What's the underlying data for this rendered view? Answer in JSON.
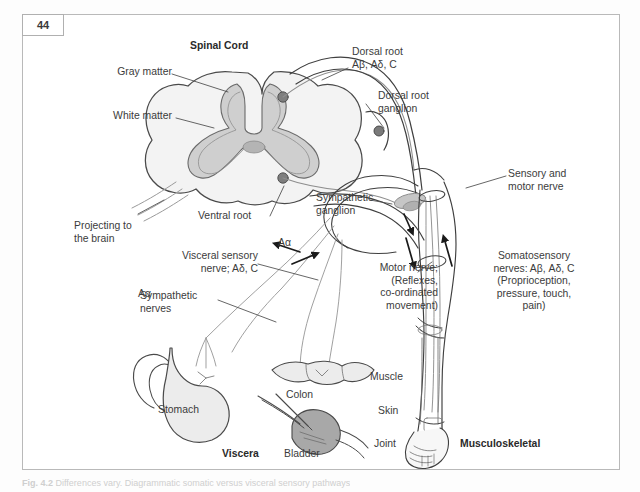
{
  "page": {
    "number": "44",
    "background_color": "#ffffff",
    "frame_color": "#b9b9b9"
  },
  "diagram": {
    "title": "Spinal Cord",
    "ink_color": "#3b3b3b",
    "fill_light": "#f1f1f1",
    "fill_mid": "#d9d9d9",
    "fill_dark": "#a9a9a9",
    "labels": {
      "spinal_cord": "Spinal Cord",
      "gray_matter": "Gray matter",
      "white_matter": "White matter",
      "dorsal_root": "Dorsal root\nAβ, Aδ, C",
      "dorsal_root_ganglion": "Dorsal root\nganglion",
      "sensory_motor_nerve": "Sensory and\nmotor nerve",
      "sympathetic_ganglion": "Sympathetic\nganglion",
      "ventral_root": "Ventral root",
      "projecting_to_brain": "Projecting to\nthe brain",
      "visceral_sensory_nerve": "Visceral sensory\nnerve; Aδ, C",
      "sympathetic_nerves": "Sympathetic\nnerves",
      "a_alpha": "Aα",
      "motor_nerve": "Motor nerve;\n(Reflexes,\nco-ordinated\nmovement)",
      "somatosensory": "Somatosensory\nnerves: Aβ, Aδ, C\n(Proprioception,\npressure, touch,\npain)",
      "stomach": "Stomach",
      "colon": "Colon",
      "bladder": "Bladder",
      "viscera": "Viscera",
      "muscle": "Muscle",
      "skin": "Skin",
      "joint": "Joint",
      "musculoskeletal": "Musculoskeletal"
    }
  },
  "caption": {
    "figure_number": "Fig. 4.2",
    "text": "Differences vary. Diagrammatic somatic versus visceral sensory pathways"
  }
}
